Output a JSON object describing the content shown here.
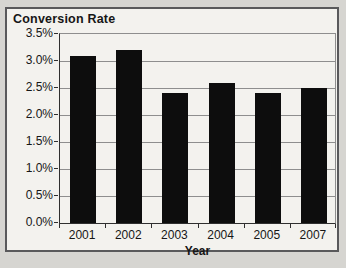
{
  "chart_data": {
    "type": "bar",
    "title": "Conversion Rate",
    "xlabel": "Year",
    "ylabel": "",
    "categories": [
      "2001",
      "2002",
      "2003",
      "2004",
      "2005",
      "2007"
    ],
    "values": [
      3.1,
      3.2,
      2.4,
      2.6,
      2.4,
      2.5
    ],
    "value_unit": "%",
    "ylim": [
      0,
      3.5
    ],
    "y_tick_step": 0.5,
    "y_tick_labels": [
      "0.0%",
      "0.5%",
      "1.0%",
      "1.5%",
      "2.0%",
      "2.5%",
      "3.0%",
      "3.5%"
    ],
    "grid": true,
    "legend": "none",
    "colors": {
      "bar": "#0d0d0d",
      "gridline": "#8e8e8e",
      "axis": "#2f2f2f",
      "text": "#161616",
      "chart_background": "#f3f2ee",
      "page_background": "#d6d5d1"
    }
  }
}
